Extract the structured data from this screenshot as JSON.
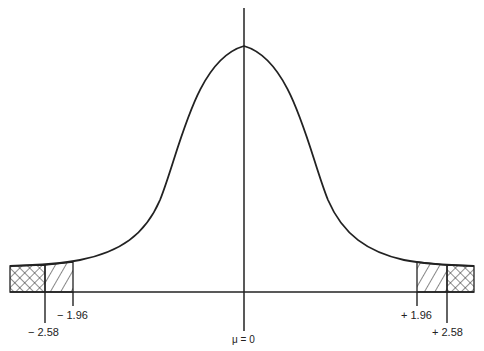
{
  "diagram": {
    "type": "normal-distribution-critical-regions",
    "mean_label": "μ = 0",
    "critical_values": [
      {
        "label": "− 2.58",
        "value": -2.58,
        "region": "cross-hatched"
      },
      {
        "label": "− 1.96",
        "value": -1.96,
        "region": "diagonal-hatched"
      },
      {
        "label": "+ 1.96",
        "value": 1.96,
        "region": "diagonal-hatched"
      },
      {
        "label": "+ 2.58",
        "value": 2.58,
        "region": "cross-hatched"
      }
    ],
    "colors": {
      "line": "#222222",
      "background": "#ffffff"
    }
  }
}
